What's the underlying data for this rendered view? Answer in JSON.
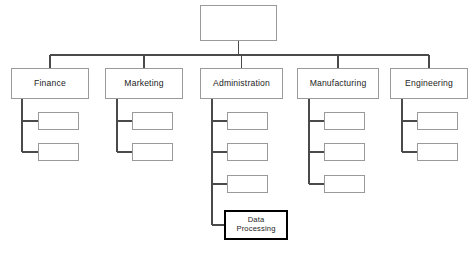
{
  "diagram": {
    "type": "organization-chart",
    "canvas": {
      "width": 476,
      "height": 255,
      "background": "#ffffff"
    },
    "style": {
      "line_color": "#4a4a4a",
      "box_border_color": "#9a9a9a",
      "emphasis_border_color": "#000000",
      "box_fill": "#ffffff",
      "text_color": "#1c1c1c"
    },
    "bus_y": 55,
    "root": {
      "id": "root",
      "label": "",
      "x": 200,
      "y": 5,
      "width": 77,
      "height": 36,
      "emphasis": false
    },
    "departments": [
      {
        "id": "finance",
        "label": "Finance",
        "x": 11,
        "y": 68,
        "width": 78,
        "height": 31,
        "stub_x": 22,
        "children": [
          {
            "id": "finance-1",
            "label": "",
            "x": 38,
            "y": 112,
            "width": 41,
            "height": 18,
            "emphasis": false
          },
          {
            "id": "finance-2",
            "label": "",
            "x": 38,
            "y": 143,
            "width": 41,
            "height": 18,
            "emphasis": false
          }
        ]
      },
      {
        "id": "marketing",
        "label": "Marketing",
        "x": 105,
        "y": 68,
        "width": 78,
        "height": 31,
        "stub_x": 117,
        "children": [
          {
            "id": "marketing-1",
            "label": "",
            "x": 132,
            "y": 112,
            "width": 41,
            "height": 18,
            "emphasis": false
          },
          {
            "id": "marketing-2",
            "label": "",
            "x": 132,
            "y": 143,
            "width": 41,
            "height": 18,
            "emphasis": false
          }
        ]
      },
      {
        "id": "administration",
        "label": "Administration",
        "x": 200,
        "y": 68,
        "width": 83,
        "height": 31,
        "stub_x": 212,
        "children": [
          {
            "id": "admin-1",
            "label": "",
            "x": 227,
            "y": 112,
            "width": 41,
            "height": 18,
            "emphasis": false
          },
          {
            "id": "admin-2",
            "label": "",
            "x": 227,
            "y": 143,
            "width": 41,
            "height": 18,
            "emphasis": false
          },
          {
            "id": "admin-3",
            "label": "",
            "x": 227,
            "y": 175,
            "width": 41,
            "height": 18,
            "emphasis": false
          },
          {
            "id": "admin-data-processing",
            "label": "Data\nProcessing",
            "x": 224,
            "y": 210,
            "width": 64,
            "height": 30,
            "emphasis": true
          }
        ]
      },
      {
        "id": "manufacturing",
        "label": "Manufacturing",
        "x": 297,
        "y": 68,
        "width": 82,
        "height": 31,
        "stub_x": 309,
        "children": [
          {
            "id": "manufacturing-1",
            "label": "",
            "x": 324,
            "y": 112,
            "width": 41,
            "height": 18,
            "emphasis": false
          },
          {
            "id": "manufacturing-2",
            "label": "",
            "x": 324,
            "y": 143,
            "width": 41,
            "height": 18,
            "emphasis": false
          },
          {
            "id": "manufacturing-3",
            "label": "",
            "x": 324,
            "y": 175,
            "width": 41,
            "height": 18,
            "emphasis": false
          }
        ]
      },
      {
        "id": "engineering",
        "label": "Engineering",
        "x": 390,
        "y": 68,
        "width": 78,
        "height": 31,
        "stub_x": 402,
        "children": [
          {
            "id": "engineering-1",
            "label": "",
            "x": 417,
            "y": 112,
            "width": 41,
            "height": 18,
            "emphasis": false
          },
          {
            "id": "engineering-2",
            "label": "",
            "x": 417,
            "y": 143,
            "width": 41,
            "height": 18,
            "emphasis": false
          }
        ]
      }
    ]
  }
}
